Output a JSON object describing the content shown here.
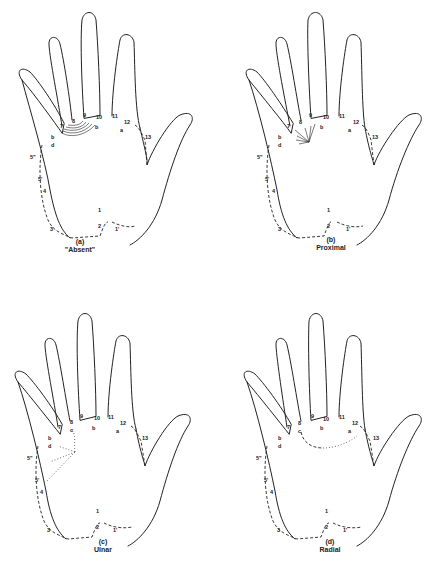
{
  "figure": {
    "panels": [
      {
        "id": "a",
        "letter": "(a)",
        "title": "\"Absent\""
      },
      {
        "id": "b",
        "letter": "(b)",
        "title": "Proximal"
      },
      {
        "id": "c",
        "letter": "(c)",
        "title": "Ulnar"
      },
      {
        "id": "d",
        "letter": "(d)",
        "title": "Radial"
      }
    ],
    "labels": {
      "l7": "7",
      "l9": "9",
      "l11": "11",
      "l13": "13",
      "l10": "10",
      "l12": "12",
      "l8": "8",
      "b1": "b",
      "d": "d",
      "b2": "b",
      "a": "a",
      "c": "c",
      "l5pp": "5\"",
      "l5p": "5'",
      "l4": "4",
      "l3": "3",
      "l1top": "1",
      "l2": "2",
      "l1p": "1'"
    }
  }
}
